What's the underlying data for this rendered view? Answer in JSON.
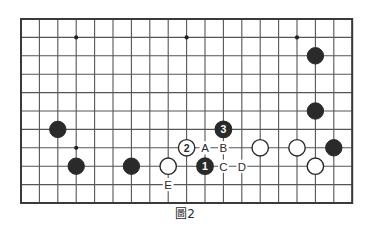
{
  "figure": {
    "caption": "圖2",
    "type": "go-board-diagram"
  },
  "board": {
    "columns": 19,
    "rows": 11,
    "origin_x": 21,
    "origin_y": 19,
    "spacing": 18.4,
    "line_color": "#555555",
    "border_color": "#3a3a3a",
    "background_color": "#ffffff",
    "star_point_color": "#222222",
    "star_points": [
      {
        "col": 3,
        "row": 1
      },
      {
        "col": 9,
        "row": 1
      },
      {
        "col": 15,
        "row": 1
      },
      {
        "col": 3,
        "row": 7
      }
    ]
  },
  "stones": {
    "black_color": "#2a2a2a",
    "white_fill": "#ffffff",
    "white_stroke": "#2a2a2a",
    "radius": 8.2,
    "black": [
      {
        "col": 16,
        "row": 2,
        "name": "black-stone-upper-right-1"
      },
      {
        "col": 16,
        "row": 5,
        "name": "black-stone-upper-right-2"
      },
      {
        "col": 2,
        "row": 6,
        "name": "black-stone-left-1"
      },
      {
        "col": 3,
        "row": 8,
        "name": "black-stone-left-2"
      },
      {
        "col": 6,
        "row": 8,
        "name": "black-stone-left-3"
      },
      {
        "col": 17,
        "row": 7,
        "name": "black-stone-right-edge"
      }
    ],
    "white": [
      {
        "col": 8,
        "row": 8,
        "name": "white-stone-center-left"
      },
      {
        "col": 13,
        "row": 7,
        "name": "white-stone-right-1"
      },
      {
        "col": 15,
        "row": 7,
        "name": "white-stone-right-2"
      },
      {
        "col": 16,
        "row": 8,
        "name": "white-stone-right-3"
      }
    ]
  },
  "numbered_moves": [
    {
      "label": "1",
      "color": "black",
      "col": 10,
      "row": 8,
      "name": "move-1-black"
    },
    {
      "label": "2",
      "color": "white",
      "col": 9,
      "row": 7,
      "name": "move-2-white"
    },
    {
      "label": "3",
      "color": "black",
      "col": 11,
      "row": 6,
      "name": "move-3-black"
    }
  ],
  "letter_points": [
    {
      "label": "A",
      "col": 10,
      "row": 7,
      "name": "point-label-a"
    },
    {
      "label": "B",
      "col": 11,
      "row": 7,
      "name": "point-label-b"
    },
    {
      "label": "C",
      "col": 11,
      "row": 8,
      "name": "point-label-c"
    },
    {
      "label": "D",
      "col": 12,
      "row": 8,
      "name": "point-label-d"
    },
    {
      "label": "E",
      "col": 8,
      "row": 9,
      "name": "point-label-e"
    }
  ],
  "colors": {
    "ink": "#2b2b2b",
    "grid": "#555555"
  }
}
